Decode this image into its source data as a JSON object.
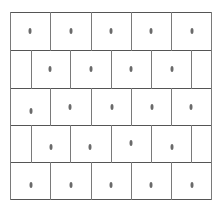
{
  "diagram": {
    "type": "brick-grid-with-centered-dots",
    "rows": 5,
    "colors": {
      "background": "#ffffff",
      "horizontal_line": "#555555",
      "vertical_line": "#7a7a7a",
      "dot": "#6a6a6a"
    },
    "bounds": {
      "left": 10,
      "right": 211,
      "top": 12,
      "bottom": 199
    },
    "horizontal_lines_y": [
      12,
      50,
      88,
      125,
      162,
      199
    ],
    "row_layout": [
      {
        "row": 1,
        "offset": false,
        "y_top": 12,
        "y_bottom": 50,
        "verticals_x": [
          10,
          50,
          91,
          131,
          171,
          211
        ]
      },
      {
        "row": 2,
        "offset": true,
        "y_top": 50,
        "y_bottom": 88,
        "verticals_x": [
          10,
          31,
          70,
          111,
          151,
          191,
          211
        ]
      },
      {
        "row": 3,
        "offset": false,
        "y_top": 88,
        "y_bottom": 125,
        "verticals_x": [
          10,
          50,
          91,
          131,
          171,
          211
        ]
      },
      {
        "row": 4,
        "offset": true,
        "y_top": 125,
        "y_bottom": 162,
        "verticals_x": [
          10,
          31,
          70,
          111,
          151,
          191,
          211
        ]
      },
      {
        "row": 5,
        "offset": false,
        "y_top": 162,
        "y_bottom": 199,
        "verticals_x": [
          10,
          50,
          91,
          131,
          171,
          211
        ]
      }
    ],
    "dots": [
      {
        "row": 1,
        "x": 30,
        "y": 31
      },
      {
        "row": 1,
        "x": 71,
        "y": 31
      },
      {
        "row": 1,
        "x": 111,
        "y": 31
      },
      {
        "row": 1,
        "x": 151,
        "y": 31
      },
      {
        "row": 1,
        "x": 192,
        "y": 31
      },
      {
        "row": 2,
        "x": 50,
        "y": 69
      },
      {
        "row": 2,
        "x": 91,
        "y": 69
      },
      {
        "row": 2,
        "x": 131,
        "y": 69
      },
      {
        "row": 2,
        "x": 172,
        "y": 69
      },
      {
        "row": 3,
        "x": 31,
        "y": 111
      },
      {
        "row": 3,
        "x": 70,
        "y": 107
      },
      {
        "row": 3,
        "x": 112,
        "y": 107
      },
      {
        "row": 3,
        "x": 152,
        "y": 107
      },
      {
        "row": 3,
        "x": 191,
        "y": 107
      },
      {
        "row": 4,
        "x": 51,
        "y": 147
      },
      {
        "row": 4,
        "x": 90,
        "y": 147
      },
      {
        "row": 4,
        "x": 131,
        "y": 143
      },
      {
        "row": 4,
        "x": 172,
        "y": 147
      },
      {
        "row": 5,
        "x": 31,
        "y": 185
      },
      {
        "row": 5,
        "x": 71,
        "y": 185
      },
      {
        "row": 5,
        "x": 111,
        "y": 185
      },
      {
        "row": 5,
        "x": 151,
        "y": 185
      },
      {
        "row": 5,
        "x": 192,
        "y": 185
      }
    ]
  }
}
